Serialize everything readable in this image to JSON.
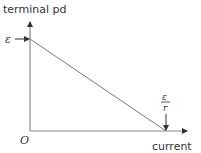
{
  "diagram": {
    "y_axis_label": "terminal pd",
    "x_axis_label": "current",
    "origin_label": "O",
    "y_intercept_label": "ε",
    "x_intercept_numerator": "ε",
    "x_intercept_denominator": "r",
    "colors": {
      "axis": "#888888",
      "line": "#777777",
      "text": "#333333"
    }
  }
}
